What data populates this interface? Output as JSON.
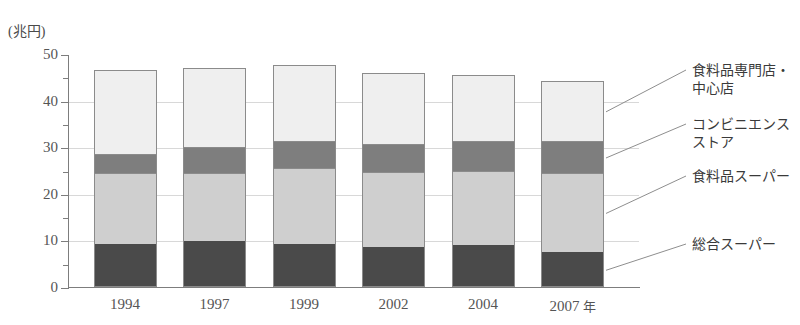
{
  "chart_data": {
    "type": "bar",
    "subtype": "stacked-vertical",
    "title": "",
    "xlabel": "年",
    "ylabel": "(兆円)",
    "y_unit_caption": "(兆円)",
    "categories": [
      "1994",
      "1997",
      "1999",
      "2002",
      "2004",
      "2007"
    ],
    "x_axis_unit_suffix": "年",
    "ylim": [
      0,
      50
    ],
    "y_ticks_major": [
      0,
      10,
      20,
      30,
      40,
      50
    ],
    "y_ticks_minor": [
      5,
      15,
      25,
      35,
      45
    ],
    "grid": true,
    "legend_position": "right-outside",
    "series": [
      {
        "name": "総合スーパー",
        "color": "#4a4a4a",
        "values": [
          9.2,
          9.8,
          9.3,
          8.5,
          9.0,
          7.6
        ]
      },
      {
        "name": "食料品スーパー",
        "color": "#cfcfcf",
        "values": [
          15.2,
          14.7,
          16.2,
          16.1,
          16.0,
          16.8
        ]
      },
      {
        "name": "コンビニエンスストア",
        "color": "#7e7e7e",
        "values": [
          4.2,
          5.5,
          5.8,
          6.0,
          6.4,
          7.0
        ]
      },
      {
        "name": "食料品専門店・中心店",
        "color": "#efefef",
        "values": [
          17.9,
          17.0,
          16.3,
          15.3,
          14.2,
          12.8
        ]
      }
    ],
    "totals": [
      46.5,
      47.0,
      47.6,
      45.9,
      45.6,
      44.2
    ]
  },
  "legend": {
    "items": [
      {
        "label_line1": "食料品専門店・",
        "label_line2": "中心店"
      },
      {
        "label_line1": "コンビニエンス",
        "label_line2": "ストア"
      },
      {
        "label_line1": "食料品スーパー",
        "label_line2": ""
      },
      {
        "label_line1": "総合スーパー",
        "label_line2": ""
      }
    ]
  }
}
